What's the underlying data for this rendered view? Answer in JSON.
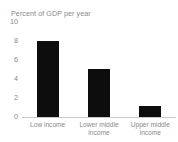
{
  "chart_data": {
    "type": "bar",
    "title": "Percent of GDP per year",
    "xlabel": "",
    "ylabel": "",
    "categories": [
      "Low income",
      "Lower middle income",
      "Upper middle income"
    ],
    "category_lines": [
      [
        "Low income"
      ],
      [
        "Lower middle",
        "income"
      ],
      [
        "Upper middle",
        "income"
      ]
    ],
    "values": [
      8.0,
      5.1,
      1.2
    ],
    "ylim": [
      0,
      10
    ],
    "yticks": [
      10,
      8,
      6,
      4,
      2,
      0
    ],
    "ytick_labels": [
      "10",
      "8",
      "6",
      "4",
      "2",
      "0"
    ],
    "grid": false,
    "legend": null,
    "bar_color": "#0d0d0d",
    "axis_color": "#c9c9c9",
    "text_color": "#8a8a8a",
    "background": "#ffffff"
  }
}
